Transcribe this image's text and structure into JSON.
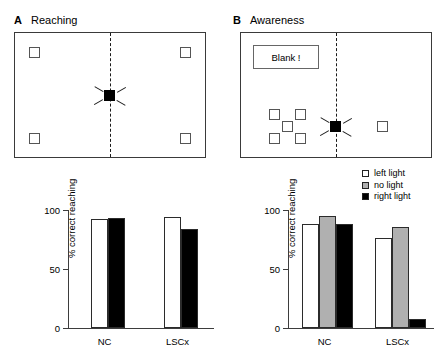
{
  "panels": {
    "a": {
      "letter": "A",
      "title": "Reaching"
    },
    "b": {
      "letter": "B",
      "title": "Awareness"
    }
  },
  "scene_b": {
    "blank_label": "Blank !"
  },
  "legend": {
    "items": [
      {
        "label": "left light",
        "color": "#ffffff"
      },
      {
        "label": "no light",
        "color": "#b0b0b0"
      },
      {
        "label": "right light",
        "color": "#000000"
      }
    ]
  },
  "chart_data": [
    {
      "id": "reaching",
      "type": "bar",
      "title": "Reaching",
      "xlabel": "",
      "ylabel": "% correct reaching",
      "ylim": [
        0,
        100
      ],
      "yticks": [
        0,
        50,
        100
      ],
      "ytick_labels": [
        "0",
        "50",
        "100"
      ],
      "grid": false,
      "legend_position": "none",
      "categories": [
        "NC",
        "LSCx"
      ],
      "series": [
        {
          "name": "left light",
          "color": "#ffffff",
          "values": [
            92,
            94
          ]
        },
        {
          "name": "right light",
          "color": "#000000",
          "values": [
            93,
            84
          ]
        }
      ]
    },
    {
      "id": "awareness",
      "type": "bar",
      "title": "Awareness",
      "xlabel": "",
      "ylabel": "% correct reaching",
      "ylim": [
        0,
        100
      ],
      "yticks": [
        0,
        50,
        100
      ],
      "ytick_labels": [
        "0",
        "50",
        "100"
      ],
      "grid": false,
      "legend_position": "upper right",
      "categories": [
        "NC",
        "LSCx"
      ],
      "series": [
        {
          "name": "left light",
          "color": "#ffffff",
          "values": [
            88,
            76
          ]
        },
        {
          "name": "no light",
          "color": "#b0b0b0",
          "values": [
            95,
            86
          ]
        },
        {
          "name": "right light",
          "color": "#000000",
          "values": [
            88,
            8
          ]
        }
      ]
    }
  ]
}
